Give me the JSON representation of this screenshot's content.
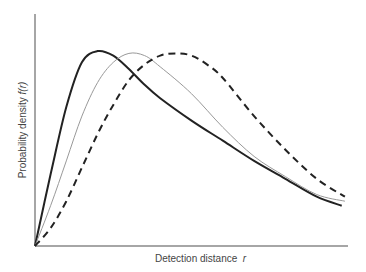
{
  "chart_data": {
    "type": "line",
    "title": "",
    "xlabel": "Detection distance r",
    "ylabel": "Probability density f(r)",
    "xlabel_text": "Detection distance",
    "xlabel_var": "r",
    "ylabel_text": "Probability density",
    "ylabel_var": "f(r)",
    "grid": false,
    "legend": null,
    "axis_ticks": false,
    "xlim": [
      0,
      1
    ],
    "ylim": [
      0,
      1
    ],
    "series": [
      {
        "name": "solid-thick",
        "style": "solid",
        "color": "#222222",
        "width": 2,
        "x": [
          0,
          0.05,
          0.1,
          0.15,
          0.2,
          0.25,
          0.3,
          0.35,
          0.4,
          0.5,
          0.6,
          0.7,
          0.8,
          0.9,
          0.98
        ],
        "y": [
          0,
          0.32,
          0.62,
          0.82,
          0.87,
          0.85,
          0.79,
          0.72,
          0.66,
          0.56,
          0.47,
          0.38,
          0.3,
          0.22,
          0.18
        ]
      },
      {
        "name": "thin-gray",
        "style": "solid",
        "color": "#999999",
        "width": 1,
        "x": [
          0,
          0.05,
          0.1,
          0.15,
          0.2,
          0.25,
          0.3,
          0.35,
          0.4,
          0.5,
          0.6,
          0.7,
          0.8,
          0.9,
          0.99
        ],
        "y": [
          0,
          0.18,
          0.38,
          0.58,
          0.73,
          0.82,
          0.86,
          0.85,
          0.8,
          0.68,
          0.53,
          0.4,
          0.31,
          0.23,
          0.2
        ]
      },
      {
        "name": "dashed",
        "style": "dashed",
        "color": "#222222",
        "width": 2,
        "x": [
          0,
          0.05,
          0.1,
          0.15,
          0.2,
          0.25,
          0.3,
          0.35,
          0.4,
          0.45,
          0.5,
          0.55,
          0.6,
          0.7,
          0.8,
          0.9,
          0.99
        ],
        "y": [
          0,
          0.08,
          0.2,
          0.35,
          0.5,
          0.63,
          0.74,
          0.81,
          0.85,
          0.86,
          0.85,
          0.81,
          0.75,
          0.58,
          0.43,
          0.3,
          0.22
        ]
      }
    ]
  },
  "plot_area": {
    "left": 35,
    "top": 14,
    "right": 348,
    "bottom": 246
  }
}
